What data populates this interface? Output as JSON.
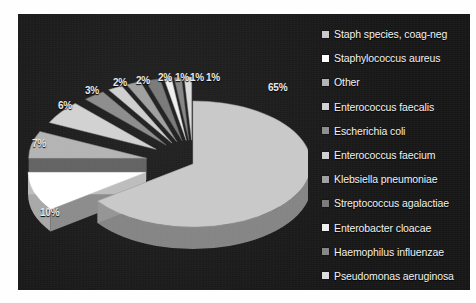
{
  "chart_data": {
    "type": "pie",
    "title": "",
    "xlabel": "",
    "ylabel": "",
    "legend_position": "right",
    "exploded": true,
    "three_d": true,
    "categories": [
      "Staph species, coag-neg",
      "Staphylococcus aureus",
      "Other",
      "Enterococcus faecalis",
      "Escherichia coli",
      "Enterococcus faecium",
      "Klebsiella pneumoniae",
      "Streptococcus agalactiae",
      "Enterobacter cloacae",
      "Haemophilus influenzae",
      "Pseudomonas aeruginosa"
    ],
    "values": [
      65,
      10,
      7,
      6,
      3,
      2,
      2,
      2,
      1,
      1,
      1
    ],
    "value_labels": [
      "65%",
      "10%",
      "7%",
      "6%",
      "3%",
      "2%",
      "2%",
      "2%",
      "1%",
      "1%",
      "1%"
    ],
    "colors": [
      "#c9c9c9",
      "#ffffff",
      "#b4b4b4",
      "#d2d2d2",
      "#8d8d8d",
      "#cfcfcf",
      "#a0a0a0",
      "#7a7a7a",
      "#efefef",
      "#868686",
      "#dcdcdc"
    ],
    "background": "#1b1b1b",
    "label_color": "#e9e9e9"
  },
  "legend": {
    "items": [
      {
        "label": "Staph species, coag-neg",
        "color": "#c9c9c9"
      },
      {
        "label": "Staphylococcus aureus",
        "color": "#ffffff"
      },
      {
        "label": "Other",
        "color": "#b4b4b4"
      },
      {
        "label": "Enterococcus faecalis",
        "color": "#d2d2d2"
      },
      {
        "label": "Escherichia coli",
        "color": "#8d8d8d"
      },
      {
        "label": "Enterococcus faecium",
        "color": "#cfcfcf"
      },
      {
        "label": "Klebsiella pneumoniae",
        "color": "#a0a0a0"
      },
      {
        "label": "Streptococcus agalactiae",
        "color": "#7a7a7a"
      },
      {
        "label": "Enterobacter cloacae",
        "color": "#efefef"
      },
      {
        "label": "Haemophilus influenzae",
        "color": "#868686"
      },
      {
        "label": "Pseudomonas aeruginosa",
        "color": "#dcdcdc"
      }
    ]
  },
  "pct_labels": [
    {
      "text": "65%",
      "x": 250,
      "y": 68
    },
    {
      "text": "10%",
      "x": 22,
      "y": 193
    },
    {
      "text": "7%",
      "x": 14,
      "y": 124
    },
    {
      "text": "6%",
      "x": 40,
      "y": 86
    },
    {
      "text": "3%",
      "x": 67,
      "y": 71
    },
    {
      "text": "2%",
      "x": 95,
      "y": 63
    },
    {
      "text": "2%",
      "x": 118,
      "y": 61
    },
    {
      "text": "2%",
      "x": 140,
      "y": 58
    },
    {
      "text": "1%",
      "x": 157,
      "y": 58
    },
    {
      "text": "1%",
      "x": 172,
      "y": 58
    },
    {
      "text": "1%",
      "x": 188,
      "y": 58
    }
  ]
}
